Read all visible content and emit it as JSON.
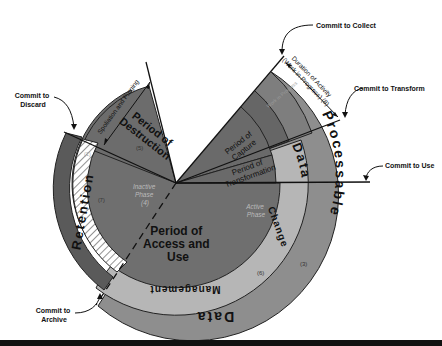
{
  "diagram": {
    "type": "lifecycle-wheel",
    "center_segments": {
      "access_and_use": {
        "label_lines": [
          "Period of",
          "Access and",
          "Use"
        ]
      },
      "destruction": {
        "label_lines": [
          "Period of",
          "Destruction"
        ],
        "number": "(5)"
      },
      "capture": {
        "label_lines": [
          "Period of",
          "Capture"
        ]
      },
      "transformation": {
        "label_lines": [
          "Period of",
          "Transformation"
        ]
      },
      "inactive_phase": {
        "label_lines": [
          "Inactive",
          "Phase"
        ],
        "number": "(4)"
      },
      "active_phase": {
        "label_lines": [
          "Active",
          "Phase"
        ]
      },
      "work_in_progress_band": {
        "label": "Work in Progress"
      }
    },
    "rings": {
      "data_change": {
        "label": "Data Change",
        "number": "(6)"
      },
      "data_management": {
        "label": "Data Management"
      },
      "processable_data": {
        "label": "Processable Data",
        "word1": "Processable",
        "word2": "Data",
        "number": "(3)"
      },
      "retention": {
        "label": "Retention",
        "number": "(1)"
      },
      "hatched_ring": {
        "number": "(7)"
      }
    },
    "annotations": {
      "commit_to_collect": "Commit to Collect",
      "commit_to_transform": "Commit to Transform",
      "commit_to_use": "Commit to Use",
      "commit_to_discard_lines": [
        "Commit to",
        "Discard"
      ],
      "commit_to_archive_lines": [
        "Commit to",
        "Archive"
      ],
      "spoliation_and_purging": "Spoliation and Purging",
      "duration_of_activity_lines": [
        "Duration of Activity",
        "(Work in Progress) (8)"
      ]
    },
    "colors": {
      "dark_core": "#6f6f6f",
      "darker_band": "#5e5e5e",
      "light_ring": "#b4b4b4",
      "outer_ring": "#8e8e8e",
      "retention": "#5a5a5a",
      "line": "#111111",
      "background": "#ffffff"
    }
  }
}
